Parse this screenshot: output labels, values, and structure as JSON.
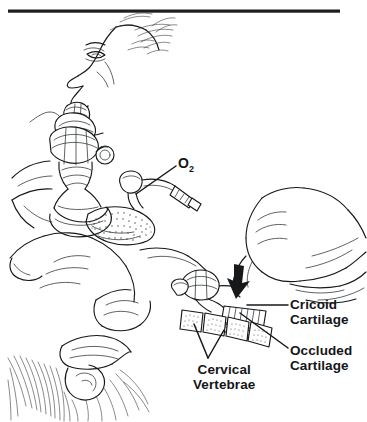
{
  "figure": {
    "kind": "medical-line-illustration",
    "background_color": "#ffffff",
    "ink_color": "#16181a",
    "rule": {
      "present": true,
      "color": "#1b1d1f"
    },
    "labels": {
      "oxygen": {
        "text": "O",
        "subscript": "2"
      },
      "cricoid": {
        "line1": "Cricoid",
        "line2": "Cartilage"
      },
      "occluded": {
        "line1": "Occluded",
        "line2": "Cartilage"
      },
      "cervical": {
        "line1": "Cervical",
        "line2": "Vertebrae"
      }
    }
  }
}
